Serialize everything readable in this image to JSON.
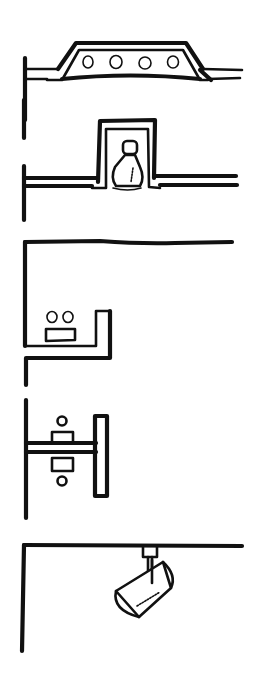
{
  "diagram": {
    "title": "",
    "ink_color": "#111111",
    "background_color": "#ffffff",
    "figures": [
      {
        "id": "surface-mounted",
        "name": "Surface-mounted ceiling fixture",
        "lamps": 4
      },
      {
        "id": "recessed",
        "name": "Recessed downlight with bulb",
        "lamps": 1
      },
      {
        "id": "cove",
        "name": "Cove lighting ledge",
        "lamps": 2
      },
      {
        "id": "wall-sconce",
        "name": "Wall-mounted up/down bracket",
        "lamps": 2
      },
      {
        "id": "track",
        "name": "Ceiling track spotlight",
        "lamps": 1
      }
    ]
  }
}
